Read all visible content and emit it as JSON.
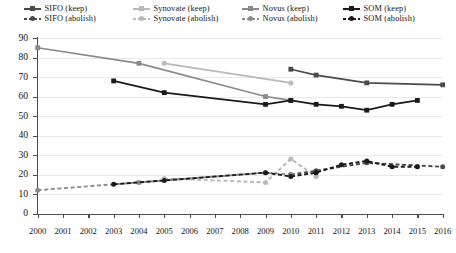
{
  "chart_data": {
    "type": "line",
    "title": "",
    "xlabel": "",
    "ylabel": "",
    "xlim": [
      2000,
      2016
    ],
    "ylim": [
      0,
      90
    ],
    "ytick_labels": [
      "0",
      "10",
      "20",
      "30",
      "40",
      "50",
      "60",
      "70",
      "80",
      "90"
    ],
    "ytick_values": [
      0,
      10,
      20,
      30,
      40,
      50,
      60,
      70,
      80,
      90
    ],
    "xtick_labels": [
      "2000",
      "2001",
      "2002",
      "2003",
      "2004",
      "2005",
      "2006",
      "2007",
      "2008",
      "2009",
      "2010",
      "2011",
      "2012",
      "2013",
      "2014",
      "2015",
      "2016"
    ],
    "grid": "horizontal",
    "legend_position": "top",
    "legend_columns": 4,
    "legend_rows": 2,
    "series": [
      {
        "name": "SIFO (keep)",
        "style": "solid",
        "color": "#4a4a4a",
        "marker": "square",
        "x": [
          2010,
          2011,
          2013,
          2016
        ],
        "values": [
          74,
          71,
          67,
          66
        ]
      },
      {
        "name": "Synovate (keep)",
        "style": "solid",
        "color": "#b9b9b9",
        "marker": "circle",
        "x": [
          2005,
          2010
        ],
        "values": [
          77,
          67
        ]
      },
      {
        "name": "Novus (keep)",
        "style": "solid",
        "color": "#8a8a8a",
        "marker": "square",
        "x": [
          2000,
          2004,
          2009,
          2010
        ],
        "values": [
          85,
          77,
          60,
          58
        ]
      },
      {
        "name": "SOM (keep)",
        "style": "solid",
        "color": "#1a1a1a",
        "marker": "square",
        "x": [
          2003,
          2005,
          2009,
          2010,
          2011,
          2012,
          2013,
          2014,
          2015
        ],
        "values": [
          68,
          62,
          56,
          58,
          56,
          55,
          53,
          56,
          58
        ]
      },
      {
        "name": "SIFO (abolish)",
        "style": "dashed",
        "color": "#4a4a4a",
        "marker": "circle",
        "x": [
          2010,
          2011,
          2013,
          2016
        ],
        "values": [
          20,
          22,
          26,
          24
        ]
      },
      {
        "name": "Synovate (abolish)",
        "style": "dashed",
        "color": "#b9b9b9",
        "marker": "circle",
        "x": [
          2005,
          2009,
          2010,
          2011
        ],
        "values": [
          18,
          16,
          28,
          19
        ]
      },
      {
        "name": "Novus (abolish)",
        "style": "dashed",
        "color": "#8a8a8a",
        "marker": "circle",
        "x": [
          2000,
          2004,
          2009,
          2010
        ],
        "values": [
          12,
          16,
          21,
          20
        ]
      },
      {
        "name": "SOM (abolish)",
        "style": "dashed",
        "color": "#1a1a1a",
        "marker": "circle",
        "x": [
          2003,
          2005,
          2009,
          2010,
          2011,
          2012,
          2013,
          2014,
          2015
        ],
        "values": [
          15,
          17,
          21,
          19,
          21,
          25,
          27,
          24,
          24
        ]
      }
    ]
  },
  "legend": {
    "items": [
      {
        "label": "SIFO (keep)",
        "color": "#4a4a4a",
        "style": "solid",
        "marker": "square"
      },
      {
        "label": "Synovate (keep)",
        "color": "#b9b9b9",
        "style": "solid",
        "marker": "square"
      },
      {
        "label": "Novus (keep)",
        "color": "#8a8a8a",
        "style": "solid",
        "marker": "square"
      },
      {
        "label": "SOM (keep)",
        "color": "#1a1a1a",
        "style": "solid",
        "marker": "square"
      },
      {
        "label": "SIFO (abolish)",
        "color": "#4a4a4a",
        "style": "dashed",
        "marker": "circle"
      },
      {
        "label": "Synovate (abolish)",
        "color": "#b9b9b9",
        "style": "dashed",
        "marker": "circle"
      },
      {
        "label": "Novus (abolish)",
        "color": "#8a8a8a",
        "style": "dashed",
        "marker": "circle"
      },
      {
        "label": "SOM (abolish)",
        "color": "#1a1a1a",
        "style": "dashed",
        "marker": "circle"
      }
    ]
  },
  "colors": {
    "axis": "#4d4d4d",
    "grid": "#e9e9ea",
    "background": "#ffffff",
    "text": "#151515"
  }
}
